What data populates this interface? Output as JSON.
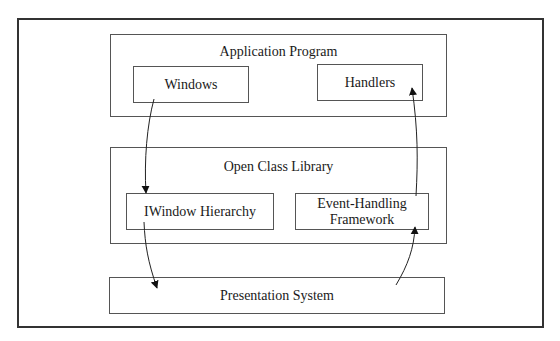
{
  "diagram": {
    "layers": [
      {
        "title": "Application Program",
        "components": [
          "Windows",
          "Handlers"
        ]
      },
      {
        "title": "Open Class Library",
        "components": [
          "IWindow Hierarchy",
          "Event-Handling Framework"
        ],
        "event_framework_lines": [
          "Event-Handling",
          "Framework"
        ]
      },
      {
        "title": "Presentation System",
        "components": []
      }
    ],
    "arrows": [
      {
        "from": "Windows",
        "to": "IWindow Hierarchy"
      },
      {
        "from": "IWindow Hierarchy",
        "to": "Presentation System"
      },
      {
        "from": "Presentation System",
        "to": "Event-Handling Framework"
      },
      {
        "from": "Event-Handling Framework",
        "to": "Handlers"
      }
    ],
    "colors": {
      "stroke": "#333333",
      "box_border": "#555555",
      "background": "#ffffff"
    }
  }
}
